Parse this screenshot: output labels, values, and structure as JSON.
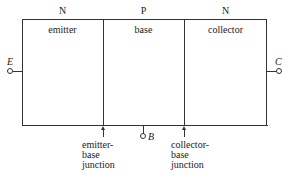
{
  "diagram": {
    "type": "NPN transistor structure",
    "regions": [
      {
        "doping": "N",
        "name": "emitter"
      },
      {
        "doping": "P",
        "name": "base"
      },
      {
        "doping": "N",
        "name": "collector"
      }
    ],
    "terminals": {
      "emitter": "E",
      "base": "B",
      "collector": "C"
    },
    "junctions": {
      "emitter_base": [
        "emitter-",
        "base",
        "junction"
      ],
      "collector_base": [
        "collector-",
        "base",
        "junction"
      ]
    }
  }
}
